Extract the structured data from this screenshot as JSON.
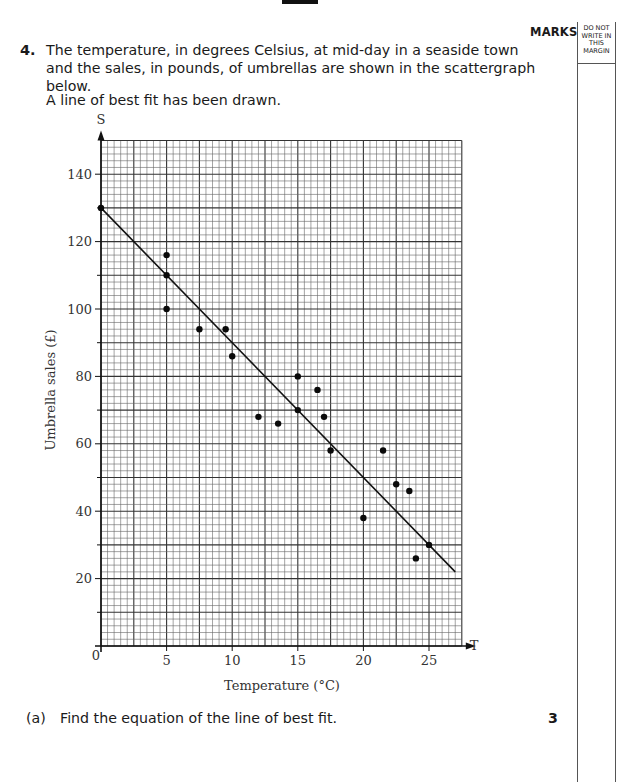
{
  "page": {
    "marks_header": "MARKS",
    "margin_header": [
      "DO NOT",
      "WRITE IN",
      "THIS",
      "MARGIN"
    ]
  },
  "question": {
    "number": "4.",
    "text": "The temperature, in degrees Celsius, at mid-day in a seaside town and the sales, in pounds, of umbrellas are shown in the scattergraph below.",
    "note": "A line of best fit has been drawn."
  },
  "part_a": {
    "label": "(a)",
    "text": "Find the equation of the line of best fit.",
    "marks": "3"
  },
  "chart_data": {
    "type": "scatter",
    "title": "",
    "xlabel": "Temperature (°C)",
    "ylabel": "Umbrella sales (£)",
    "x_axis_symbol": "T",
    "y_axis_symbol": "S",
    "origin_label": "0",
    "xlim": [
      0,
      27.5
    ],
    "ylim": [
      0,
      150
    ],
    "x_ticks": [
      5,
      10,
      15,
      20,
      25
    ],
    "y_ticks": [
      20,
      40,
      60,
      80,
      100,
      120,
      140
    ],
    "grid": true,
    "grid_minor": {
      "x": 0.5,
      "y": 2
    },
    "grid_major": {
      "x": 2.5,
      "y": 10
    },
    "points": [
      {
        "x": 0,
        "y": 130
      },
      {
        "x": 5,
        "y": 116
      },
      {
        "x": 5,
        "y": 110
      },
      {
        "x": 5,
        "y": 100
      },
      {
        "x": 7.5,
        "y": 94
      },
      {
        "x": 9.5,
        "y": 94
      },
      {
        "x": 10,
        "y": 86
      },
      {
        "x": 12,
        "y": 68
      },
      {
        "x": 13.5,
        "y": 66
      },
      {
        "x": 15,
        "y": 80
      },
      {
        "x": 15,
        "y": 70
      },
      {
        "x": 16.5,
        "y": 76
      },
      {
        "x": 17,
        "y": 68
      },
      {
        "x": 17.5,
        "y": 58
      },
      {
        "x": 20,
        "y": 38
      },
      {
        "x": 21.5,
        "y": 58
      },
      {
        "x": 22.5,
        "y": 48
      },
      {
        "x": 23.5,
        "y": 46
      },
      {
        "x": 24,
        "y": 26
      },
      {
        "x": 25,
        "y": 30
      }
    ],
    "line_of_best_fit": {
      "start": {
        "x": 0,
        "y": 130
      },
      "end": {
        "x": 27,
        "y": 22
      },
      "slope": -4,
      "intercept": 130
    }
  }
}
